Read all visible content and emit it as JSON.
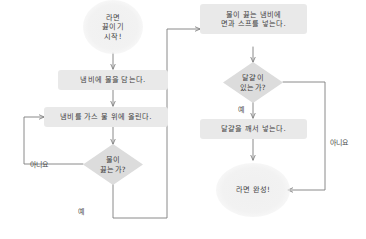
{
  "diagram": {
    "language": "ko",
    "colors": {
      "process_fill": "#e9e9e9",
      "decision_fill": "#dcdcdc",
      "terminal_fill": "#f1f1f1",
      "edge_stroke": "#7d7d7d",
      "text": "#3f3f3f",
      "background": "#ffffff"
    },
    "nodes": [
      {
        "id": "start",
        "type": "terminal",
        "lines": [
          "라면",
          "끓이기",
          "시작!"
        ]
      },
      {
        "id": "fill-water",
        "type": "process",
        "lines": [
          "냄비에 물을 담는다."
        ]
      },
      {
        "id": "put-on-stove",
        "type": "process",
        "lines": [
          "냄비를 가스 불 위에 올린다."
        ]
      },
      {
        "id": "is-boiling",
        "type": "decision",
        "lines": [
          "물이",
          "끓는가?"
        ]
      },
      {
        "id": "add-noodles",
        "type": "process",
        "lines": [
          "물이 끓는 냄비에",
          "면과 스프를 넣는다."
        ]
      },
      {
        "id": "has-egg",
        "type": "decision",
        "lines": [
          "달걀이",
          "있는가?"
        ]
      },
      {
        "id": "add-egg",
        "type": "process",
        "lines": [
          "달걀을 깨서 넣는다."
        ]
      },
      {
        "id": "done",
        "type": "terminal",
        "lines": [
          "라면 완성!"
        ]
      }
    ],
    "edge_labels": {
      "boiling_no": "아니요",
      "boiling_yes": "예",
      "egg_yes": "예",
      "egg_no": "아니요"
    }
  }
}
